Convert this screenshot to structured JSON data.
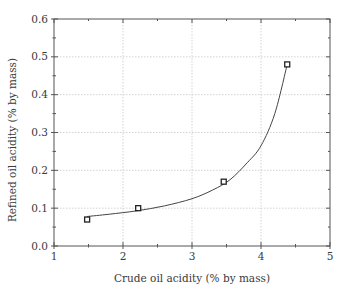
{
  "chart_data": {
    "type": "scatter",
    "title": "",
    "xlabel": "Crude oil acidity (% by mass)",
    "ylabel": "Refined oil acidity (% by mass)",
    "xlim": [
      1,
      5
    ],
    "ylim": [
      0.0,
      0.6
    ],
    "x_ticks": [
      1,
      2,
      3,
      4,
      5
    ],
    "x_tick_labels": [
      "1",
      "2",
      "3",
      "4",
      "5"
    ],
    "y_ticks": [
      0.0,
      0.1,
      0.2,
      0.3,
      0.4,
      0.5,
      0.6
    ],
    "y_tick_labels": [
      "0.0",
      "0.1",
      "0.2",
      "0.3",
      "0.4",
      "0.5",
      "0.6"
    ],
    "grid": true,
    "legend": null,
    "series": [
      {
        "name": "Measured data",
        "marker": "hollow-square",
        "x": [
          1.48,
          2.22,
          3.46,
          4.38
        ],
        "y": [
          0.07,
          0.1,
          0.17,
          0.48
        ]
      },
      {
        "name": "Fitted curve",
        "style": "line",
        "x": [
          1.48,
          1.8,
          2.2,
          2.6,
          3.0,
          3.3,
          3.55,
          3.8,
          4.0,
          4.2,
          4.38
        ],
        "y": [
          0.078,
          0.084,
          0.093,
          0.106,
          0.125,
          0.148,
          0.175,
          0.22,
          0.265,
          0.35,
          0.48
        ]
      }
    ]
  },
  "colors": {
    "axis": "#555555",
    "grid": "#c8c8c8",
    "marker": "#222222",
    "curve": "#444444",
    "text": "#3a3a3a"
  }
}
